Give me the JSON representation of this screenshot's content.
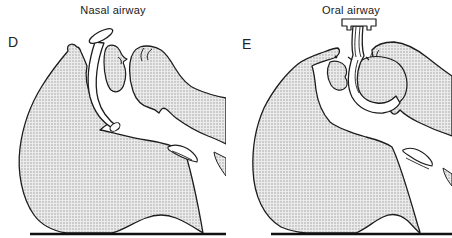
{
  "figure": {
    "caption_panels": [
      {
        "label": "D",
        "title": "Nasal airway"
      },
      {
        "label": "E",
        "title": "Oral airway"
      }
    ],
    "colors": {
      "outline": "#1d1d1d",
      "stipple_base": "#ebebeb",
      "stipple_dot": "#9f9f9f",
      "ground_line": "#111111",
      "background": "#ffffff"
    }
  }
}
